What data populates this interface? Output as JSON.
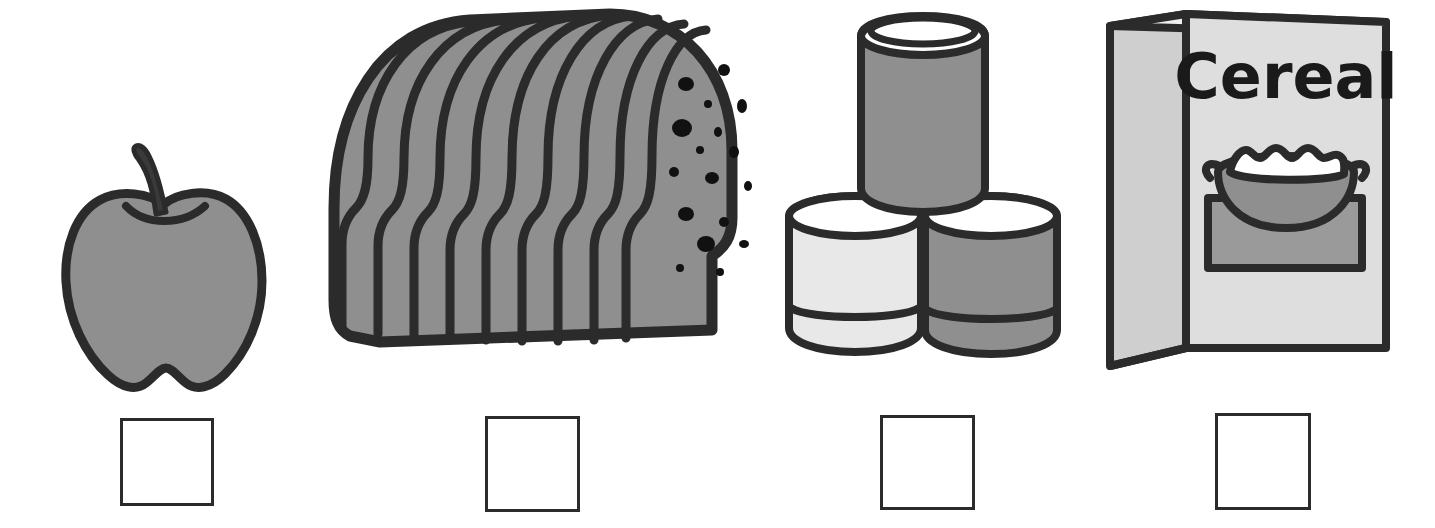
{
  "page": {
    "background_color": "#ffffff",
    "width": 1435,
    "height": 528,
    "style": "black-and-white line-art clipart",
    "instruction_text": ""
  },
  "palette": {
    "outline": "#2b2b2b",
    "outline_dark": "#1a1a1a",
    "fill_mid_gray": "#8f8f8f",
    "fill_light_gray": "#d9d9d9",
    "fill_pale_gray": "#e3e3e3",
    "fill_white": "#ffffff",
    "crumb_spot": "#111111",
    "box_border": "#2b2b2b"
  },
  "items": [
    {
      "id": "apple",
      "icon_name": "apple-icon",
      "label": "apple",
      "fill": "#8f8f8f",
      "x": 62,
      "y": 150,
      "width": 190,
      "height": 245,
      "parts": [
        "stem",
        "leaf-notch",
        "body",
        "bottom-notch"
      ]
    },
    {
      "id": "bread",
      "icon_name": "sliced-bread-loaf-icon",
      "label": "bread",
      "fill": "#8f8f8f",
      "x": 335,
      "y": 140,
      "width": 410,
      "height": 235,
      "slice_count": 9,
      "crumb_spot_count": 17
    },
    {
      "id": "cans",
      "icon_name": "stacked-cans-icon",
      "label": "cans",
      "x": 785,
      "y": 48,
      "width": 290,
      "height": 330,
      "cans": [
        {
          "position": "top",
          "fill": "#8f8f8f"
        },
        {
          "position": "bottom-left",
          "fill": "#e3e3e3"
        },
        {
          "position": "bottom-right",
          "fill": "#8f8f8f"
        }
      ]
    },
    {
      "id": "cereal",
      "icon_name": "cereal-box-icon",
      "label": "cereal",
      "box_text": "Cereal",
      "front_fill": "#dedede",
      "side_fill": "#d2d2d2",
      "x": 1100,
      "y": 10,
      "width": 285,
      "height": 355,
      "graphic": {
        "name": "cereal-bowl-graphic",
        "mat_fill": "#9a9a9a",
        "bowl_fill": "#8f8f8f",
        "flakes_fill": "#ffffff"
      }
    }
  ],
  "answer_boxes": [
    {
      "id": "answer-box-apple",
      "for_item": "apple",
      "value": "",
      "x": 120,
      "y": 418,
      "width": 94,
      "height": 88
    },
    {
      "id": "answer-box-bread",
      "for_item": "bread",
      "value": "",
      "x": 485,
      "y": 416,
      "width": 95,
      "height": 96
    },
    {
      "id": "answer-box-cans",
      "for_item": "cans",
      "value": "",
      "x": 880,
      "y": 415,
      "width": 95,
      "height": 95
    },
    {
      "id": "answer-box-cereal",
      "for_item": "cereal",
      "value": "",
      "x": 1215,
      "y": 413,
      "width": 96,
      "height": 97
    }
  ]
}
